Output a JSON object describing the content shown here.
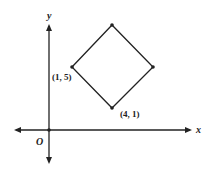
{
  "diagram": {
    "type": "coordinate-plane",
    "axes": {
      "x_label": "x",
      "y_label": "y",
      "origin_label": "O"
    },
    "shape": "square",
    "labeled_vertices": [
      {
        "label": "(1, 5)",
        "position": "left"
      },
      {
        "label": "(4, 1)",
        "position": "bottom"
      }
    ]
  }
}
